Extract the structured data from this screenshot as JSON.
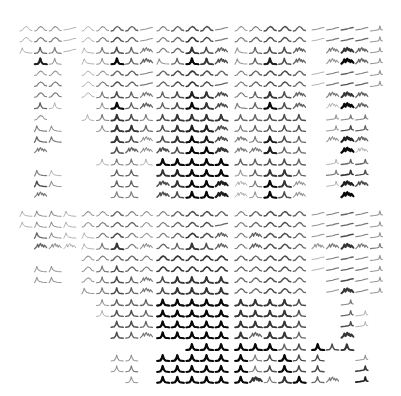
{
  "chart_data": {
    "type": "small-multiples-sparkline-grid",
    "title": "",
    "xlabel": "",
    "ylabel": "",
    "legend": [],
    "grid": false,
    "layout": {
      "panels": 2,
      "rows_per_panel": 16,
      "row_groups": [
        4,
        4,
        4,
        4
      ],
      "columns": 24,
      "column_groups": [
        4,
        5,
        5,
        5,
        5
      ],
      "cell_width": 15,
      "cell_height": 11
    },
    "shape_legend": {
      "w": "broad symmetric bump",
      "p": "sharp central peak",
      "f": "flat / gently rising line",
      "s": "left-skewed peak with long right tail",
      "m": "multi-peaked / noisy",
      "r": "ramp with late peak"
    },
    "encoding": "each cell is shape letter + darkness 1-9 (9 = darkest / strongest), '..' = empty",
    "panels": [
      {
        "name": "top",
        "rows": [
          "w2w3w3f2w2w3w5w5f3w4w5w6w6f4w3w4w6w6w5f3f4f5f4r3",
          "w2w4w4f2w2w4w6w5f3w4w5w7w6f4w4w5w6w6w5f2f4f5f5r3",
          "s2p5p4f2s2p4p6p5m4w4w5p7p6m5s3p5p6p6m5..m4m7m5r3",
          "..p8p3..s2p3p9p5m5s3p5p9p7m6s3p5p8p6m5..m3m9m5r3",
          "..w3w3..w2w3w5w5f4w5w6w7w6w5w4w5w6w6w5f2f4f5f4r3",
          "..w4w4..w2w4w6w5f4w5w6w7w6f5w4w5w6w6w5f2f4f6f5r3",
          "..w4w4..w2p4p6p5m4p5p6p8p7m6w4p5p7p6m5..m4m7m5..",
          "..p5p2....p3p9p5m5p5p6p9p7m6s4p5p9p6m5..m2m9m5..",
          "..w3....p2p4p7p6p4p6p7p7p7p7p5p5p6p6p6..r3r4r4..",
          "..s4s3....p3p7p7p5p6p7p8p8m6p4p5p6p6p6..r3r6r5..",
          "..s5s4......p7p6m3p6p7p9p8m6m4p4p8p6p5..m3m8m5..",
          "..m4........p6m5m3m6p6p9p9m7m4m4p8p5p5....m9m2..",
          "..........p2p4p4p2p9p9p9p9p9p5p5p6p6p5..r2r5r5..",
          "..s4s2......p5p5..p7p8p9p9p9p3p5p7p7p5..r4r7r6..",
          "..s6s3......p5p5..m6p7p9p9m8m2p4p9p7m3..r2m8m6..",
          "..m4........p4p4..m6p6p9p9m8m2p3p9p6m3....m9...."
        ]
      },
      {
        "name": "bottom",
        "rows": [
          "s2s3s3s2w3w3w5w4w3w4w5w6w6w5w4w5w6w6w5f3f4f5f4r3",
          "s2s3s3s2w3w4w5w5w3w4w5w6w6f5w4w5w6w6w5f3f4f5f4r3",
          "..s5s3s2s2w4w6w4w3w4w5w7w6m5w4m5w6w6w5f3f4f6f4r3",
          "..m5m3m2s2p4p7w4m3w5p5p7p6m5w4m5w6w6w5m3m4m7m4r4",
          "........w3w4w5w5w4w7w7w7w7w7w5w5w6w6w5f2f4f5f4r3",
          "..s3s3..w3p4p6w5w4w7w7w7w7w7w5w5w6w6w5f2f4f5f4r3",
          "..s3s3..w3p4p6p5m4p6p7p7p7p7w5w5w6w6w5..f4f6f4r3",
          "........s3p4p6p5m4p6p7p7p7p7w5w5w6w6w5..f3m7f4r3",
          "..........p3p5p5p5p9p9p9p9p9p7p7p7p7p6....r4....",
          "..........p2p6p6p5p9p9p9p9p9p7p7p7p7p6....r5r2..",
          "............p6p6p5p9p9p9p9p9p7p7p7p7p6....r6r2..",
          "............p6p5m4p9p9p9p9p9p7m5p7p7p5....m7....",
          "......................p9p9p9p9p9p9p5p6p9p6p7....",
          "............p3p3..p9p9p9p9p9p9p4p6p9p6p6....r3..",
          "............p3p4..p9p9p9p9p9p9p4p6p9p6p6....r7..",
          "..............p3..p9p9p9p9p9p9m7p4p7p9p5m4..r8.."
        ]
      }
    ]
  }
}
